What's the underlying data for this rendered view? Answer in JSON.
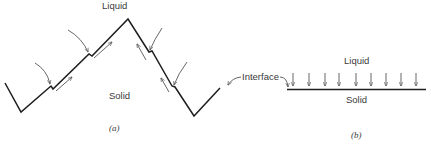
{
  "panel_a": {
    "liquid_label": "Liquid",
    "solid_label": "Solid",
    "caption": "(a)"
  },
  "panel_b": {
    "interface_label": "Interface",
    "liquid_label": "Liquid",
    "solid_label": "Solid",
    "caption": "(b)",
    "arrow_count": 9
  },
  "colors": {
    "line": "#1e1e1e",
    "arrow": "#555555",
    "text": "#3a3a3a"
  }
}
